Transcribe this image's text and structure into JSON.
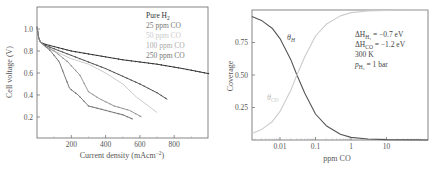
{
  "chart_data": [
    {
      "type": "line",
      "title": "",
      "xlabel": "Current density (mAcm⁻²)",
      "ylabel": "Cell voltage (V)",
      "xlim": [
        0,
        1000
      ],
      "ylim": [
        0.01,
        1.2
      ],
      "xticks": [
        200,
        400,
        600,
        800
      ],
      "xtick_labels": [
        "200",
        "400",
        "600",
        "800"
      ],
      "yticks": [
        0.2,
        0.4,
        0.6,
        0.8,
        1.0
      ],
      "ytick_labels": [
        "0.2",
        "0.4",
        "0.6",
        "0.8",
        "1.0"
      ],
      "grid": false,
      "legend_position": "upper right (inside)",
      "series": [
        {
          "name": "Pure H₂",
          "color": "#333333",
          "markers": true,
          "x": [
            0,
            10,
            20,
            50,
            100,
            200,
            350,
            500,
            700,
            850,
            1000
          ],
          "y": [
            1.02,
            0.92,
            0.88,
            0.86,
            0.84,
            0.8,
            0.76,
            0.72,
            0.68,
            0.64,
            0.595
          ]
        },
        {
          "name": "25 ppm CO",
          "color": "#555555",
          "markers": true,
          "x": [
            0,
            10,
            20,
            50,
            100,
            200,
            300,
            400,
            500,
            600,
            700,
            760
          ],
          "y": [
            1.02,
            0.92,
            0.88,
            0.85,
            0.82,
            0.76,
            0.7,
            0.64,
            0.57,
            0.5,
            0.42,
            0.36
          ]
        },
        {
          "name": "50 ppm CO",
          "color": "#cccccc",
          "markers": false,
          "x": [
            0,
            10,
            20,
            50,
            100,
            200,
            300,
            400,
            500,
            580,
            650,
            700
          ],
          "y": [
            1.02,
            0.92,
            0.88,
            0.84,
            0.8,
            0.73,
            0.68,
            0.6,
            0.5,
            0.38,
            0.3,
            0.24
          ]
        },
        {
          "name": "100 ppm CO",
          "color": "#999999",
          "markers": true,
          "x": [
            0,
            10,
            20,
            50,
            100,
            180,
            250,
            300,
            360,
            450,
            540,
            610
          ],
          "y": [
            1.02,
            0.92,
            0.88,
            0.84,
            0.8,
            0.7,
            0.58,
            0.43,
            0.37,
            0.3,
            0.26,
            0.2
          ]
        },
        {
          "name": "250 ppm CO",
          "color": "#777777",
          "markers": true,
          "x": [
            0,
            10,
            20,
            50,
            80,
            130,
            160,
            190,
            240,
            300,
            400,
            500,
            560
          ],
          "y": [
            1.02,
            0.92,
            0.88,
            0.84,
            0.8,
            0.7,
            0.58,
            0.46,
            0.4,
            0.3,
            0.26,
            0.22,
            0.18
          ]
        }
      ]
    },
    {
      "type": "line",
      "title": "",
      "xlabel": "ppm CO",
      "ylabel": "Coverage",
      "xscale": "log",
      "xlim": [
        0.0015,
        150
      ],
      "ylim": [
        0,
        1.0
      ],
      "xticks": [
        0.01,
        0.1,
        1,
        10
      ],
      "xtick_labels": [
        "0.01",
        "0.1",
        "1",
        "10"
      ],
      "yticks": [
        0.25,
        0.5,
        0.75
      ],
      "ytick_labels": [
        "0.25",
        "0.50",
        "0.75"
      ],
      "grid": false,
      "annotations": [
        "ΔH_H₂ = −0.7 eV",
        "ΔH_CO = −1.2 eV",
        "300 K",
        "p_H₂ = 1 bar"
      ],
      "series": [
        {
          "name": "θ_H",
          "color": "#555555",
          "x": [
            0.0015,
            0.003,
            0.006,
            0.01,
            0.02,
            0.03,
            0.05,
            0.1,
            0.2,
            0.5,
            1,
            3,
            10,
            150
          ],
          "y": [
            0.95,
            0.92,
            0.86,
            0.78,
            0.62,
            0.5,
            0.36,
            0.2,
            0.11,
            0.045,
            0.02,
            0.008,
            0.003,
            0.0
          ]
        },
        {
          "name": "θ_CO",
          "color": "#cccccc",
          "x": [
            0.0015,
            0.003,
            0.006,
            0.01,
            0.02,
            0.03,
            0.05,
            0.1,
            0.2,
            0.5,
            1,
            3,
            10,
            150
          ],
          "y": [
            0.05,
            0.08,
            0.14,
            0.22,
            0.38,
            0.5,
            0.64,
            0.8,
            0.89,
            0.955,
            0.98,
            0.992,
            0.997,
            1.0
          ]
        }
      ]
    }
  ],
  "left": {
    "ylabel": "Cell voltage (V)",
    "xlabel_main": "Current density (mAcm",
    "xlabel_sup": "−2",
    "xlabel_end": ")",
    "legend": [
      "Pure H",
      "25 ppm CO",
      "50 ppm CO",
      "100 ppm CO",
      "250 ppm CO"
    ],
    "legend_sub": "2"
  },
  "right": {
    "ylabel": "Coverage",
    "xlabel": "ppm CO",
    "label_h": "θ",
    "label_h_sub": "H",
    "label_co": "θ",
    "label_co_sub": "CO",
    "annot1": "ΔH",
    "annot1_sub": "H₂",
    "annot1_val": " = −0.7 eV",
    "annot2": "ΔH",
    "annot2_sub": "CO",
    "annot2_val": " = −1.2 eV",
    "annot3": "300 K",
    "annot4": "p",
    "annot4_sub": "H₂",
    "annot4_val": " = 1 bar"
  }
}
